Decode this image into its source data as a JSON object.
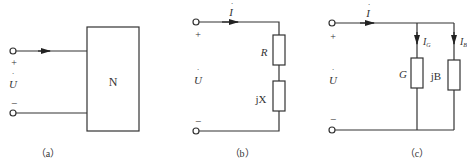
{
  "panels": [
    {
      "id": "a",
      "caption": "（a）",
      "voltage_label": "U",
      "plus": "+",
      "minus": "−",
      "network_label": "N"
    },
    {
      "id": "b",
      "caption": "（b）",
      "voltage_label": "U",
      "current_label": "I",
      "plus": "+",
      "minus": "−",
      "components": [
        {
          "label": "R"
        },
        {
          "label": "jX"
        }
      ]
    },
    {
      "id": "c",
      "caption": "（c）",
      "voltage_label": "U",
      "current_label": "I",
      "plus": "+",
      "minus": "−",
      "branches": [
        {
          "label": "G",
          "current": "I",
          "current_sub": "G"
        },
        {
          "label": "jB",
          "current": "I",
          "current_sub": "B"
        }
      ]
    }
  ]
}
